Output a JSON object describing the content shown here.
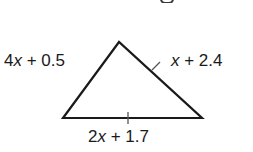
{
  "figure": {
    "type": "triangle",
    "vertices": {
      "apex": [
        119,
        42
      ],
      "bottom_left": [
        63,
        118
      ],
      "bottom_right": [
        202,
        118
      ]
    },
    "stroke_color": "#1a1a1a",
    "tick_color": "#555555",
    "congruence_ticks": [
      {
        "side": "right",
        "count": 1
      },
      {
        "side": "bottom",
        "count": 1
      }
    ]
  },
  "labels": {
    "left": {
      "coef": "4",
      "var": "x",
      "rest": " + 0.5"
    },
    "right": {
      "coef": "",
      "var": "x",
      "rest": " + 2.4"
    },
    "bottom": {
      "coef": "2",
      "var": "x",
      "rest": " + 1.7"
    }
  }
}
